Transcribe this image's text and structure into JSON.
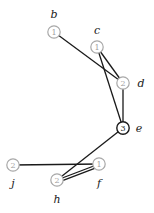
{
  "graph": {
    "nodes": [
      {
        "id": "b",
        "label": "b",
        "value": "1",
        "x": 54,
        "y": 32,
        "lx": 54,
        "ly": 14,
        "dark": false
      },
      {
        "id": "c",
        "label": "c",
        "value": "1",
        "x": 97,
        "y": 47,
        "lx": 97,
        "ly": 30,
        "dark": false
      },
      {
        "id": "d",
        "label": "d",
        "value": "2",
        "x": 123,
        "y": 83,
        "lx": 141,
        "ly": 83,
        "dark": false
      },
      {
        "id": "e",
        "label": "e",
        "value": "3",
        "x": 123,
        "y": 128,
        "lx": 139,
        "ly": 128,
        "dark": true
      },
      {
        "id": "j",
        "label": "j",
        "value": "2",
        "x": 13,
        "y": 165,
        "lx": 13,
        "ly": 183,
        "dark": false
      },
      {
        "id": "f",
        "label": "f",
        "value": "1",
        "x": 99,
        "y": 164,
        "lx": 99,
        "ly": 183,
        "dark": false
      },
      {
        "id": "h",
        "label": "h",
        "value": "2",
        "x": 57,
        "y": 180,
        "lx": 57,
        "ly": 199,
        "dark": false
      }
    ],
    "edges": [
      {
        "from": "b",
        "to": "d"
      },
      {
        "from": "c",
        "to": "d"
      },
      {
        "from": "c",
        "to": "e"
      },
      {
        "from": "d",
        "to": "e"
      },
      {
        "from": "e",
        "to": "h"
      },
      {
        "from": "j",
        "to": "f"
      },
      {
        "from": "h",
        "to": "f"
      },
      {
        "from": "h",
        "to": "f",
        "offset": 2.5
      }
    ]
  }
}
